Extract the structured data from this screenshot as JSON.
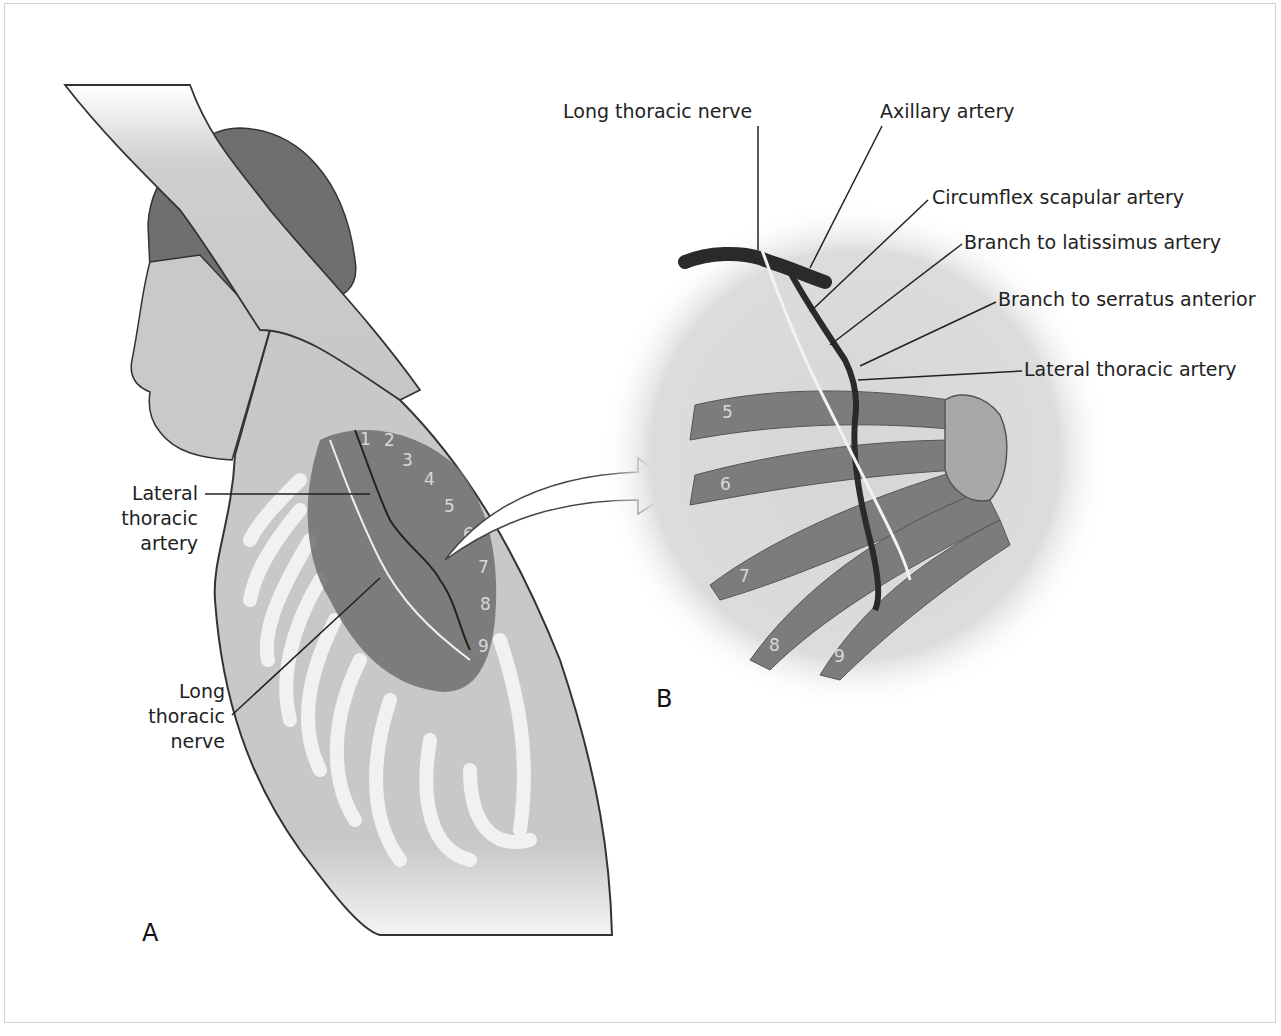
{
  "figure": {
    "panels": [
      {
        "id": "A",
        "label": "A"
      },
      {
        "id": "B",
        "label": "B"
      }
    ],
    "panel_a_labels": {
      "lateral_thoracic_artery": [
        "Lateral",
        "thoracic",
        "artery"
      ],
      "long_thoracic_nerve": [
        "Long",
        "thoracic",
        "nerve"
      ]
    },
    "panel_b_labels": {
      "long_thoracic_nerve": "Long thoracic nerve",
      "axillary_artery": "Axillary artery",
      "circumflex_scapular_artery": "Circumflex scapular artery",
      "branch_to_latissimus_artery": "Branch to latissimus artery",
      "branch_to_serratus_anterior": "Branch to serratus anterior",
      "lateral_thoracic_artery": "Lateral thoracic artery"
    },
    "panel_a_digits": [
      "1",
      "2",
      "3",
      "4",
      "5",
      "6",
      "7",
      "8",
      "9"
    ],
    "panel_b_digits": [
      "5",
      "6",
      "7",
      "8",
      "9"
    ],
    "colors": {
      "skin": "#c9c9c9",
      "hair": "#6f6f6f",
      "muscle": "#7a7a7a",
      "rib": "#f2f2f2",
      "artery": "#2a2a2a",
      "nerve": "#f0f0f0",
      "circle_bg": "#dcdcdc",
      "leader_line": "#222222"
    }
  }
}
